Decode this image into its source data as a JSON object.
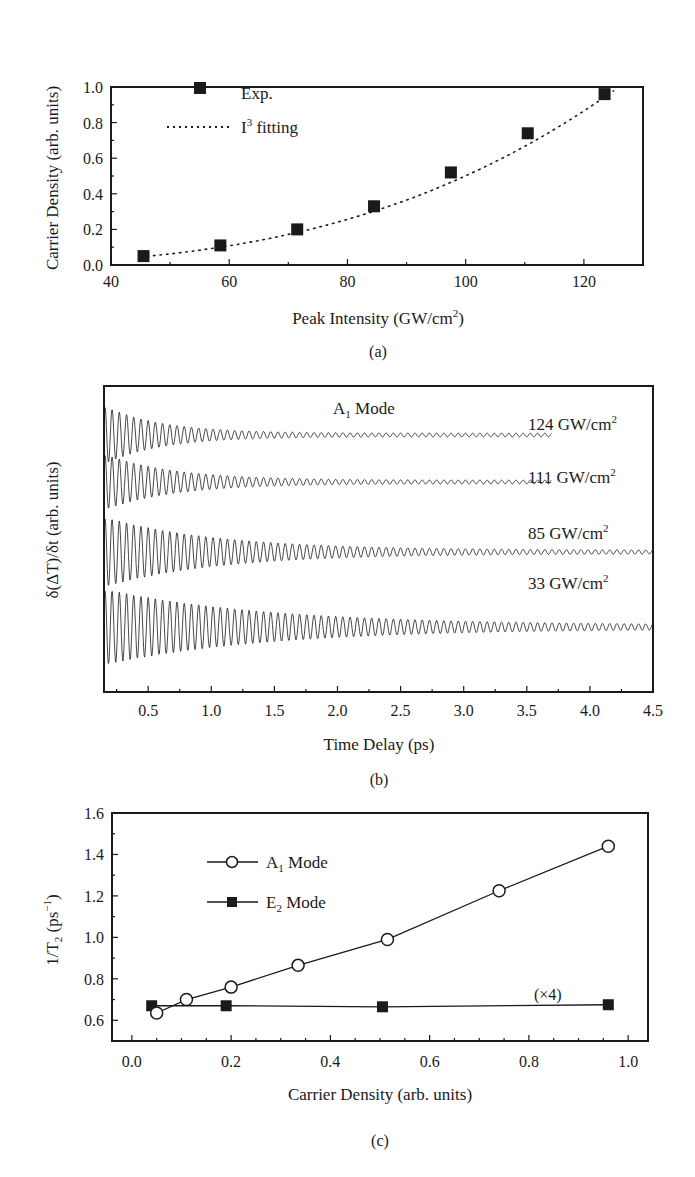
{
  "chart_data": [
    {
      "panel": "(a)",
      "type": "scatter",
      "title": "",
      "xlabel": "Peak Intensity (GW/cm²)",
      "ylabel": "Carrier Density (arb. units)",
      "xlim": [
        40,
        130
      ],
      "ylim": [
        0,
        1.0
      ],
      "xticks": [
        "40",
        "60",
        "80",
        "100",
        "120"
      ],
      "yticks": [
        "0.0",
        "0.2",
        "0.4",
        "0.6",
        "0.8",
        "1.0"
      ],
      "grid": false,
      "legend_position": "upper-left",
      "series": [
        {
          "name": "Exp.",
          "marker": "filled-square",
          "x": [
            45.5,
            58.5,
            71.5,
            84.5,
            97.5,
            110.5,
            123.5
          ],
          "y": [
            0.05,
            0.11,
            0.2,
            0.33,
            0.52,
            0.74,
            0.96
          ]
        },
        {
          "name": "I³ fitting",
          "style": "dotted-line",
          "model": "y = (x/125)^3 * 1.0"
        }
      ]
    },
    {
      "panel": "(b)",
      "type": "line",
      "title": "",
      "annotation": "A₁ Mode",
      "xlabel": "Time Delay (ps)",
      "ylabel": "δ(ΔT)/δt (arb. units)",
      "xlim": [
        0.15,
        4.5
      ],
      "xticks": [
        "0.5",
        "1.0",
        "1.5",
        "2.0",
        "2.5",
        "3.0",
        "3.5",
        "4.0",
        "4.5"
      ],
      "yticks": [],
      "grid": false,
      "series": [
        {
          "name": "124 GW/cm²",
          "t_end": 3.7,
          "decay_time_ps": 0.45,
          "trace": "damped-oscillation"
        },
        {
          "name": "111 GW/cm²",
          "t_end": 3.7,
          "decay_time_ps": 0.55,
          "trace": "damped-oscillation"
        },
        {
          "name": "85 GW/cm²",
          "t_end": 4.5,
          "decay_time_ps": 0.9,
          "trace": "damped-oscillation"
        },
        {
          "name": "33 GW/cm²",
          "t_end": 4.5,
          "decay_time_ps": 1.3,
          "trace": "damped-oscillation"
        }
      ]
    },
    {
      "panel": "(c)",
      "type": "line",
      "title": "",
      "xlabel": "Carrier Density (arb. units)",
      "ylabel": "1/T₂ (ps⁻¹)",
      "xlim": [
        -0.04,
        1.04
      ],
      "ylim": [
        0.5,
        1.6
      ],
      "xticks": [
        "0.0",
        "0.2",
        "0.4",
        "0.6",
        "0.8",
        "1.0"
      ],
      "yticks": [
        "0.6",
        "0.8",
        "1.0",
        "1.2",
        "1.4",
        "1.6"
      ],
      "grid": false,
      "legend_position": "upper-left",
      "annotation": "(×4)",
      "series": [
        {
          "name": "A₁ Mode",
          "marker": "open-circle",
          "x": [
            0.05,
            0.11,
            0.2,
            0.335,
            0.515,
            0.74,
            0.96
          ],
          "y": [
            0.635,
            0.7,
            0.76,
            0.865,
            0.99,
            1.225,
            1.44
          ]
        },
        {
          "name": "E₂ Mode",
          "marker": "filled-square",
          "x": [
            0.04,
            0.19,
            0.505,
            0.96
          ],
          "y": [
            0.67,
            0.67,
            0.665,
            0.675
          ]
        }
      ]
    }
  ],
  "panels": {
    "a": {
      "label": "(a)",
      "ylabel": "Carrier Density (arb. units)",
      "xlabel_main": "Peak Intensity (GW/cm",
      "xlabel_sup": "2",
      "xlabel_end": ")",
      "legend_exp": "Exp.",
      "legend_fit_main": "I",
      "legend_fit_sup": "3",
      "legend_fit_end": " fitting"
    },
    "b": {
      "label": "(b)",
      "ylabel": "δ(ΔT)/δt (arb. units)",
      "xlabel": "Time Delay (ps)",
      "mode_main": "A",
      "mode_sub": "1",
      "mode_end": " Mode",
      "traces": [
        {
          "main": "124 GW/cm",
          "sup": "2"
        },
        {
          "main": "111 GW/cm",
          "sup": "2"
        },
        {
          "main": "85 GW/cm",
          "sup": "2"
        },
        {
          "main": "33 GW/cm",
          "sup": "2"
        }
      ]
    },
    "c": {
      "label": "(c)",
      "ylabel_main": "1/T",
      "ylabel_sub": "2",
      "ylabel_mid": " (ps",
      "ylabel_sup": "−1",
      "ylabel_end": ")",
      "xlabel": "Carrier Density (arb. units)",
      "legend_a1_main": "A",
      "legend_a1_sub": "1",
      "legend_a1_end": " Mode",
      "legend_e2_main": "E",
      "legend_e2_sub": "2",
      "legend_e2_end": " Mode",
      "annotation": "(×4)"
    }
  },
  "colors": {
    "ink": "#1a1a1a",
    "background": "#ffffff"
  }
}
